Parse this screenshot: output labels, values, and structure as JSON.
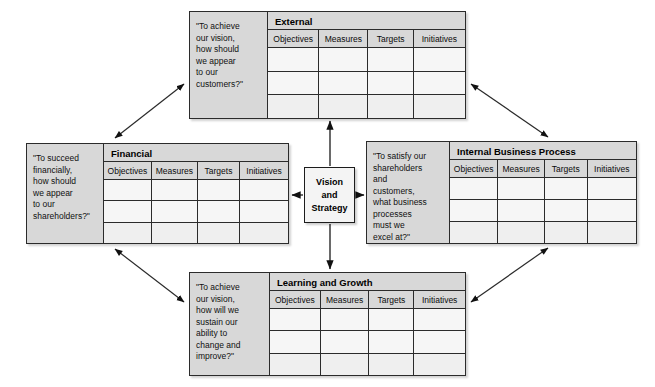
{
  "diagram": {
    "center": {
      "line1": "Vision",
      "line2": "and",
      "line3": "Strategy"
    },
    "column_headers": [
      "Objectives",
      "Measures",
      "Targets",
      "Initiatives"
    ],
    "row_count": 3,
    "colors": {
      "panel_fill": "#f3f3f3",
      "header_fill": "#d8d8d8",
      "question_fill": "#d8d8d8",
      "cell_fill": "#f6f6f6",
      "border": "#2b2b2b",
      "background": "#ffffff"
    },
    "panels": [
      {
        "id": "external",
        "title": "External",
        "question": "\"To achieve\nour vision,\nhow should\nwe appear\nto our\ncustomers?\""
      },
      {
        "id": "financial",
        "title": "Financial",
        "question": "\"To succeed\nfinancially,\nhow should\nwe appear\nto our\nshareholders?\""
      },
      {
        "id": "internal",
        "title": "Internal Business Process",
        "question": "\"To satisfy our\nshareholders\nand\ncustomers,\nwhat business\nprocesses\nmust we\nexcel at?\""
      },
      {
        "id": "learning",
        "title": "Learning and Growth",
        "question": "\"To achieve\nour vision,\nhow will we\nsustain our\nability to\nchange and\nimprove?\""
      }
    ],
    "connectors": [
      {
        "name": "center-to-external",
        "style": "single-arrow",
        "direction": "up"
      },
      {
        "name": "center-to-financial",
        "style": "single-arrow",
        "direction": "left"
      },
      {
        "name": "center-to-internal",
        "style": "single-arrow",
        "direction": "right"
      },
      {
        "name": "center-to-learning",
        "style": "single-arrow",
        "direction": "down"
      },
      {
        "name": "financial-to-external",
        "style": "double-arrow",
        "direction": "diagonal"
      },
      {
        "name": "external-to-internal",
        "style": "double-arrow",
        "direction": "diagonal"
      },
      {
        "name": "financial-to-learning",
        "style": "double-arrow",
        "direction": "diagonal"
      },
      {
        "name": "learning-to-internal",
        "style": "double-arrow",
        "direction": "diagonal"
      }
    ]
  }
}
